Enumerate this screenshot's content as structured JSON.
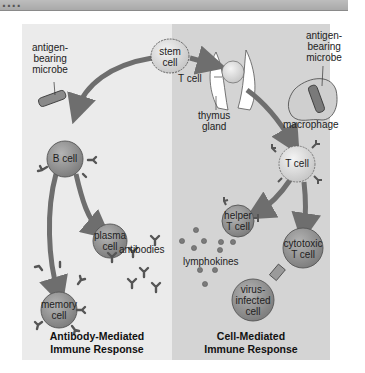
{
  "header": {
    "fragment": "...."
  },
  "panels": {
    "left": {
      "caption_line1": "Antibody-Mediated",
      "caption_line2": "Immune Response",
      "color": "#ebebeb"
    },
    "right": {
      "caption_line1": "Cell-Mediated",
      "caption_line2": "Immune Response",
      "color": "#d4d4d4"
    }
  },
  "labels": {
    "stem_cell_1": "stem",
    "stem_cell_2": "cell",
    "antigen_left_1": "antigen-",
    "antigen_left_2": "bearing",
    "antigen_left_3": "microbe",
    "antigen_right_1": "antigen-",
    "antigen_right_2": "bearing",
    "antigen_right_3": "microbe",
    "b_cell": "B cell",
    "plasma_cell_1": "plasma",
    "plasma_cell_2": "cell",
    "antibodies": "antibodies",
    "memory_cell_1": "memory",
    "memory_cell_2": "cell",
    "t_cell_thymus": "T cell",
    "thymus_1": "thymus",
    "thymus_2": "gland",
    "macrophage": "macrophage",
    "t_cell": "T cell",
    "helper_1": "helper",
    "helper_2": "T cell",
    "lymphokines": "lymphokines",
    "cytotoxic_1": "cytotoxic",
    "cytotoxic_2": "T cell",
    "virus_1": "virus-",
    "virus_2": "infected",
    "virus_3": "cell"
  },
  "colors": {
    "cell_dark": "#8c8c8c",
    "cell_light": "#d8d8d8",
    "arrow": "#6e6e6e",
    "outline": "#444444"
  }
}
